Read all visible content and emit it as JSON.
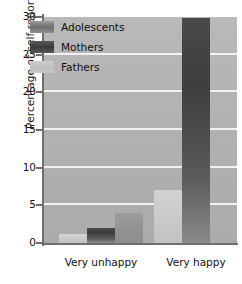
{
  "chart_data": {
    "type": "bar",
    "title": "",
    "xlabel": "",
    "ylabel": "Percentage of self-reports",
    "categories": [
      "Very unhappy",
      "Very happy"
    ],
    "series": [
      {
        "name": "Adolescents",
        "values": [
          1.2,
          7.0
        ],
        "color": "#cccccc"
      },
      {
        "name": "Mothers",
        "values": [
          2.0,
          29.9
        ],
        "color": "#3d3d3d"
      },
      {
        "name": "Fathers",
        "values": [
          4.0,
          0.0
        ],
        "color": "#949494"
      }
    ],
    "ylim": [
      0,
      30
    ],
    "yticks": [
      0,
      5,
      10,
      15,
      20,
      25,
      30
    ],
    "ytick_labels": [
      "0",
      "5",
      "10",
      "15",
      "20",
      "25",
      "30"
    ],
    "grid": true,
    "legend_position": "upper-left-inside",
    "plot_background": "#b2b2b2",
    "gridline_color": "#f2f2f2",
    "axis_color": "#6f6f6f"
  },
  "legend": {
    "items": [
      {
        "label": "Adolescents",
        "swatch": "swatch-adolescents"
      },
      {
        "label": "Mothers",
        "swatch": "swatch-mothers"
      },
      {
        "label": "Fathers",
        "swatch": "swatch-fathers"
      }
    ]
  }
}
